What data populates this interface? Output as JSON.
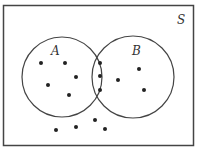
{
  "diagram": {
    "type": "venn",
    "universe_label": "S",
    "sets": [
      {
        "label": "A",
        "cx": 62,
        "cy": 77,
        "r": 40
      },
      {
        "label": "B",
        "cx": 133,
        "cy": 77,
        "r": 41
      }
    ],
    "points": {
      "A_only": [
        [
          41,
          63
        ],
        [
          65,
          63
        ],
        [
          76,
          77
        ],
        [
          48,
          85
        ],
        [
          69,
          95
        ]
      ],
      "A_and_B": [
        [
          100,
          63
        ],
        [
          100,
          76
        ],
        [
          100,
          90
        ]
      ],
      "B_only": [
        [
          118,
          80
        ],
        [
          139,
          69
        ],
        [
          144,
          90
        ]
      ],
      "outside": [
        [
          56,
          130
        ],
        [
          76,
          127
        ],
        [
          95,
          120
        ],
        [
          105,
          129
        ]
      ]
    },
    "counts": {
      "A_only": 5,
      "A_and_B": 3,
      "B_only": 3,
      "outside": 4
    }
  }
}
